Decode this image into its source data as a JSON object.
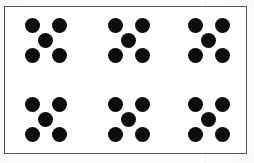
{
  "figure": {
    "border_color": "#565656",
    "background_color": "#ffffff",
    "dot_color": "#0d0d0d",
    "total_dots": 30,
    "group_count": 6,
    "dots_per_group": 5,
    "columns": 3,
    "rows": 2,
    "pattern_name": "quincunx"
  },
  "chart_data": {
    "type": "scatter",
    "xlabel": "",
    "ylabel": "",
    "grid": false,
    "legend": null,
    "groups": [
      {
        "id": "group-1",
        "row": 1,
        "column": 1,
        "dot_count": 5,
        "pattern": "quincunx",
        "dots": [
          {
            "position": "top-left",
            "x": 20,
            "y": 11
          },
          {
            "position": "top-right",
            "x": 47,
            "y": 11
          },
          {
            "position": "center",
            "x": 33,
            "y": 26
          },
          {
            "position": "bottom-left",
            "x": 20,
            "y": 41
          },
          {
            "position": "bottom-right",
            "x": 47,
            "y": 41
          }
        ]
      },
      {
        "id": "group-2",
        "row": 1,
        "column": 2,
        "dot_count": 5,
        "pattern": "quincunx",
        "dots": [
          {
            "position": "top-left",
            "x": 103,
            "y": 11
          },
          {
            "position": "top-right",
            "x": 130,
            "y": 11
          },
          {
            "position": "center",
            "x": 116,
            "y": 26
          },
          {
            "position": "bottom-left",
            "x": 103,
            "y": 41
          },
          {
            "position": "bottom-right",
            "x": 130,
            "y": 41
          }
        ]
      },
      {
        "id": "group-3",
        "row": 1,
        "column": 3,
        "dot_count": 5,
        "pattern": "quincunx",
        "dots": [
          {
            "position": "top-left",
            "x": 183,
            "y": 11
          },
          {
            "position": "top-right",
            "x": 210,
            "y": 11
          },
          {
            "position": "center",
            "x": 196,
            "y": 26
          },
          {
            "position": "bottom-left",
            "x": 183,
            "y": 41
          },
          {
            "position": "bottom-right",
            "x": 210,
            "y": 41
          }
        ]
      },
      {
        "id": "group-4",
        "row": 2,
        "column": 1,
        "dot_count": 5,
        "pattern": "quincunx",
        "dots": [
          {
            "position": "top-left",
            "x": 20,
            "y": 90
          },
          {
            "position": "top-right",
            "x": 47,
            "y": 90
          },
          {
            "position": "center",
            "x": 33,
            "y": 105
          },
          {
            "position": "bottom-left",
            "x": 20,
            "y": 120
          },
          {
            "position": "bottom-right",
            "x": 47,
            "y": 120
          }
        ]
      },
      {
        "id": "group-5",
        "row": 2,
        "column": 2,
        "dot_count": 5,
        "pattern": "quincunx",
        "dots": [
          {
            "position": "top-left",
            "x": 103,
            "y": 90
          },
          {
            "position": "top-right",
            "x": 130,
            "y": 90
          },
          {
            "position": "center",
            "x": 116,
            "y": 105
          },
          {
            "position": "bottom-left",
            "x": 103,
            "y": 120
          },
          {
            "position": "bottom-right",
            "x": 130,
            "y": 120
          }
        ]
      },
      {
        "id": "group-6",
        "row": 2,
        "column": 3,
        "dot_count": 5,
        "pattern": "quincunx",
        "dots": [
          {
            "position": "top-left",
            "x": 183,
            "y": 90
          },
          {
            "position": "top-right",
            "x": 210,
            "y": 90
          },
          {
            "position": "center",
            "x": 196,
            "y": 105
          },
          {
            "position": "bottom-left",
            "x": 183,
            "y": 120
          },
          {
            "position": "bottom-right",
            "x": 210,
            "y": 120
          }
        ]
      }
    ]
  }
}
